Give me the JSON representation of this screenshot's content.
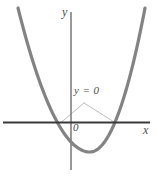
{
  "figure": {
    "background_color": "#ffffff",
    "axis_color": "#3a3a3a",
    "y_axis_color": "#6e6e6e",
    "curve_color": "#838383",
    "leader_color": "#b5b5b5",
    "text_color": "#4d4d4d",
    "labels": {
      "y_axis": "y",
      "x_axis": "x",
      "origin": "0",
      "callout": "y = 0"
    }
  },
  "chart_data": {
    "type": "line",
    "title": "",
    "subtitle": "",
    "xlabel": "x",
    "ylabel": "y",
    "grid": false,
    "legend": null,
    "axes": {
      "x_axis_pixel_y": 122,
      "y_axis_pixel_x": 71,
      "x_axis_span_px": [
        3,
        150
      ],
      "y_axis_span_px": [
        12,
        170
      ],
      "origin_label": "0",
      "xlim": [
        -2.4,
        2.6
      ],
      "ylim": [
        -1.2,
        4.6
      ]
    },
    "series": [
      {
        "name": "parabola",
        "kind": "quadratic",
        "equation": "y = a(x - h)^2 + k",
        "opens": "up",
        "vertex": {
          "x": 0.63,
          "y": -0.95,
          "pixel": [
            90,
            152
          ]
        },
        "roots": [
          {
            "x": -0.33,
            "pixel": [
              61,
              122
            ]
          },
          {
            "x": 1.59,
            "pixel": [
              115,
              122
            ]
          }
        ],
        "endpoints_pixel": [
          [
            18,
            8
          ],
          [
            145,
            8
          ]
        ],
        "stroke_width_px": 3.2,
        "color": "#838383"
      }
    ],
    "annotations": [
      {
        "name": "y-equals-zero-callout",
        "text": "y = 0",
        "text_pixel": [
          74,
          85
        ],
        "leader_apex_pixel": [
          84,
          103
        ],
        "leader_targets_pixel": [
          [
            61,
            122
          ],
          [
            115,
            122
          ]
        ],
        "note": "thin leader lines point from the label to the two x-intercepts where y = 0"
      }
    ]
  }
}
